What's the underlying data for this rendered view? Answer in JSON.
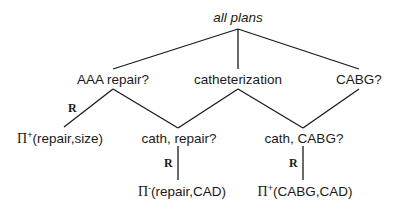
{
  "diagram": {
    "root": "all plans",
    "level1": [
      "AAA repair?",
      "catheterization",
      "CABG?"
    ],
    "level2": [
      "cath, repair?",
      "cath, CABG?"
    ],
    "leaves": [
      {
        "pi": "Π",
        "sign": "+",
        "args": "(repair,size)"
      },
      {
        "pi": "Π",
        "sign": "-",
        "args": "(repair,CAD)"
      },
      {
        "pi": "Π",
        "sign": "+",
        "args": "(CABG,CAD)"
      }
    ],
    "edge_label": "R",
    "line_color": "#1a1a1a"
  }
}
